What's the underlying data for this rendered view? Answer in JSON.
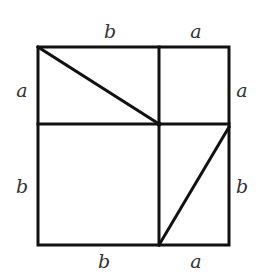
{
  "diagram": {
    "labels": {
      "top_left": "b",
      "top_right": "a",
      "left_top": "a",
      "left_bottom": "b",
      "right_top": "a",
      "right_bottom": "b",
      "bottom_left": "b",
      "bottom_right": "a"
    },
    "colors": {
      "line": "#111111",
      "text": "#333333",
      "background": "#ffffff"
    }
  }
}
